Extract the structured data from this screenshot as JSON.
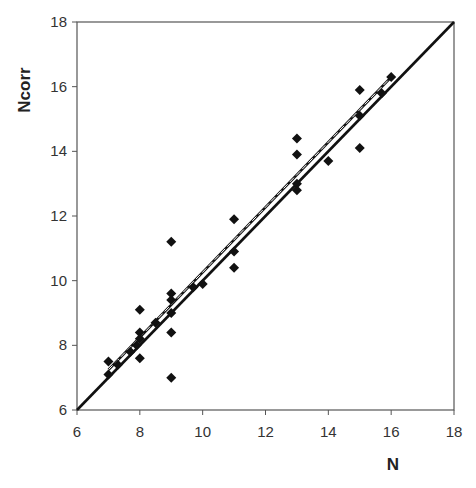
{
  "chart_data": {
    "type": "scatter",
    "title": "",
    "xlabel": "N",
    "ylabel": "Ncorr",
    "xlim": [
      6,
      18
    ],
    "ylim": [
      6,
      18
    ],
    "xticks": [
      6,
      8,
      10,
      12,
      14,
      16,
      18
    ],
    "yticks": [
      6,
      8,
      10,
      12,
      14,
      16,
      18
    ],
    "grid": false,
    "legend": null,
    "series": [
      {
        "name": "data",
        "marker": "diamond",
        "color": "#111111",
        "points": [
          {
            "x": 7,
            "y": 7.5
          },
          {
            "x": 7,
            "y": 7.1
          },
          {
            "x": 7.3,
            "y": 7.4
          },
          {
            "x": 7.7,
            "y": 7.8
          },
          {
            "x": 7.9,
            "y": 8.0
          },
          {
            "x": 8,
            "y": 9.1
          },
          {
            "x": 8,
            "y": 8.4
          },
          {
            "x": 8,
            "y": 8.2
          },
          {
            "x": 8,
            "y": 7.6
          },
          {
            "x": 8.5,
            "y": 8.7
          },
          {
            "x": 9,
            "y": 11.2
          },
          {
            "x": 9,
            "y": 9.6
          },
          {
            "x": 9,
            "y": 9.4
          },
          {
            "x": 9,
            "y": 9.0
          },
          {
            "x": 9,
            "y": 8.4
          },
          {
            "x": 9,
            "y": 7.0
          },
          {
            "x": 9.7,
            "y": 9.8
          },
          {
            "x": 10,
            "y": 9.9
          },
          {
            "x": 11,
            "y": 11.9
          },
          {
            "x": 11,
            "y": 10.9
          },
          {
            "x": 11,
            "y": 10.4
          },
          {
            "x": 13,
            "y": 14.4
          },
          {
            "x": 13,
            "y": 13.9
          },
          {
            "x": 13,
            "y": 13.0
          },
          {
            "x": 13,
            "y": 12.8
          },
          {
            "x": 14,
            "y": 13.7
          },
          {
            "x": 15,
            "y": 15.9
          },
          {
            "x": 15,
            "y": 15.1
          },
          {
            "x": 15,
            "y": 14.1
          },
          {
            "x": 15.7,
            "y": 15.8
          },
          {
            "x": 16,
            "y": 16.3
          }
        ]
      }
    ],
    "lines": [
      {
        "name": "identity y=x",
        "style": "solid",
        "from": [
          6,
          6
        ],
        "to": [
          18,
          18
        ]
      },
      {
        "name": "regression fit",
        "style": "solid",
        "from": [
          7,
          7.15
        ],
        "to": [
          16,
          16.2
        ]
      },
      {
        "name": "regression fit (dashed white)",
        "style": "dashed",
        "from": [
          7,
          7.2
        ],
        "to": [
          16,
          16.25
        ]
      }
    ]
  }
}
